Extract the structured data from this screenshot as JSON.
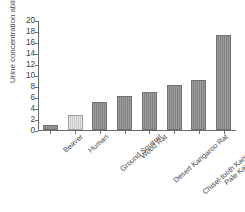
{
  "chart_data": {
    "type": "bar",
    "title": "",
    "xlabel": "",
    "ylabel": "Urine concentration ability (relative)",
    "ylim": [
      0,
      20
    ],
    "ytick_labels": [
      "20",
      "18",
      "16",
      "14",
      "12",
      "10",
      "8",
      "6",
      "4",
      "2",
      "0"
    ],
    "ytick_values": [
      20,
      18,
      16,
      14,
      12,
      10,
      8,
      6,
      4,
      2,
      0
    ],
    "grid": false,
    "legend": "none",
    "categories": [
      "Beaver",
      "Human",
      "Ground Squirrel",
      "Wood Rat",
      "Desert Kangaroo Rat",
      "Chisel-tooth Kangaroo Rat",
      "Pale Kangaroo Mouse",
      "Desert Pocket Mouse"
    ],
    "values": [
      1.0,
      2.7,
      5.1,
      6.2,
      6.9,
      8.2,
      9.1,
      17.3
    ],
    "bar_colors": [
      "#8a8a8a",
      "#d2d2d2",
      "#8a8a8a",
      "#8a8a8a",
      "#8a8a8a",
      "#8a8a8a",
      "#8a8a8a",
      "#8a8a8a"
    ]
  },
  "colors": {
    "bar_default": "#8a8a8a",
    "bar_highlight": "#d2d2d2",
    "axis": "#6b6b6b",
    "text": "#3d3d3d",
    "background": "#ffffff"
  }
}
